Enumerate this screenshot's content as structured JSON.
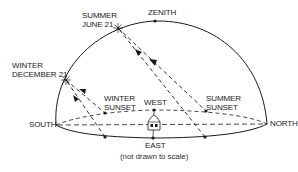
{
  "diagram": {
    "type": "celestial-sun-path",
    "labels": {
      "zenith": "ZENITH",
      "summer_line1": "SUMMER",
      "summer_line2": "JUNE 21",
      "winter_line1": "WINTER",
      "winter_line2": "DECEMBER 21",
      "winter_sunset_line1": "WINTER",
      "winter_sunset_line2": "SUNSET",
      "west": "WEST",
      "summer_sunset_line1": "SUMMER",
      "summer_sunset_line2": "SUNSET",
      "south": "SOUTH",
      "north": "NORTH",
      "east": "EAST",
      "caption": "(not drawn to scale)"
    },
    "colors": {
      "line": "#1a1a1a",
      "background": "#ffffff"
    },
    "points": {
      "zenith": [
        155,
        21
      ],
      "summer_solstice_noon": [
        118,
        28
      ],
      "winter_solstice_noon": [
        66,
        80
      ],
      "south": [
        56,
        125
      ],
      "north": [
        267,
        124
      ],
      "west": [
        154,
        110
      ],
      "east": [
        153,
        138
      ],
      "winter_sunset": [
        105,
        113
      ],
      "winter_sunrise": [
        105,
        137
      ],
      "summer_sunset": [
        206,
        111
      ],
      "summer_sunrise": [
        205,
        137
      ],
      "observer_house": [
        154,
        124
      ]
    }
  }
}
